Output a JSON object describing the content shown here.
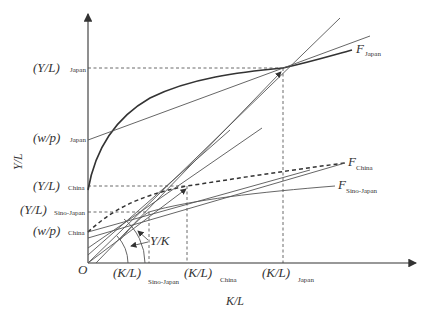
{
  "axes": {
    "x_title": "K/L",
    "y_title": "Y/L",
    "origin": "O"
  },
  "y_labels": [
    {
      "main": "(Y/L)",
      "sub": "Japan"
    },
    {
      "main": "(w/p)",
      "sub": "Japan"
    },
    {
      "main": "(Y/L)",
      "sub": "China"
    },
    {
      "main": "(Y/L)",
      "sub": "Sino-Japan"
    },
    {
      "main": "(w/p)",
      "sub": "China"
    }
  ],
  "x_labels": [
    {
      "main": "(K/L)",
      "sub": "Sino-Japan"
    },
    {
      "main": "(K/L)",
      "sub": "China"
    },
    {
      "main": "(K/L)",
      "sub": "Japan"
    }
  ],
  "curves": [
    {
      "main": "F",
      "sub": "Japan"
    },
    {
      "main": "F",
      "sub": "China"
    },
    {
      "main": "F",
      "sub": "Sino-Japan"
    }
  ],
  "annotation": "Y/K"
}
